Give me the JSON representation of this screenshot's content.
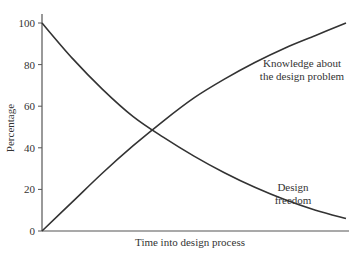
{
  "chart_data": {
    "type": "line",
    "title": "",
    "xlabel": "Time into design process",
    "ylabel": "Percentage",
    "ylim": [
      0,
      100
    ],
    "yticks": [
      0,
      20,
      40,
      60,
      80,
      100
    ],
    "xticks": [],
    "grid": false,
    "legend": "none (series labeled by inline annotations)",
    "x": [
      0,
      0.1,
      0.2,
      0.3,
      0.4,
      0.5,
      0.6,
      0.7,
      0.8,
      0.9,
      1.0
    ],
    "series": [
      {
        "name": "Knowledge about the design problem",
        "annotation": [
          "Knowledge about",
          "the design problem"
        ],
        "values": [
          0,
          14,
          28,
          41,
          53,
          64,
          73,
          81,
          88,
          94,
          100
        ]
      },
      {
        "name": "Design freedom",
        "annotation": [
          "Design",
          "freedom"
        ],
        "values": [
          100,
          83,
          68,
          55,
          45,
          36,
          28,
          21,
          15,
          10,
          6
        ]
      }
    ],
    "colors": {
      "line": "#333333",
      "axis": "#555555",
      "text": "#333333"
    }
  }
}
